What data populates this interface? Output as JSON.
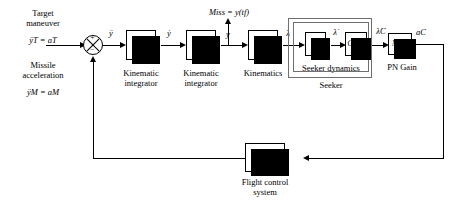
{
  "diagram": {
    "inputs": {
      "target_maneuver_caption_line1": "Target",
      "target_maneuver_caption_line2": "maneuver",
      "target_maneuver_equation": "ÿT = aT",
      "missile_accel_caption_line1": "Missile",
      "missile_accel_caption_line2": "acceleration",
      "missile_accel_equation": "ÿM = aM"
    },
    "summing_junction": {
      "name": "sum-junction",
      "sign_top": "+",
      "sign_bottom": "−"
    },
    "signals": {
      "accel_error": "ÿ",
      "rate": "ẏ",
      "displacement": "y",
      "los_angle": "λ",
      "los_rate": "λ̇",
      "los_rate_command": "λ̇C",
      "accel_command": "aC",
      "miss_distance": "Miss = y(tf)"
    },
    "blocks": [
      {
        "id": "kinematic-integrator-1",
        "text_num": "1",
        "text_den": "s",
        "caption_line1": "Kinematic",
        "caption_line2": "integrator"
      },
      {
        "id": "kinematic-integrator-2",
        "text_num": "1",
        "text_den": "s",
        "caption_line1": "Kinematic",
        "caption_line2": "integrator"
      },
      {
        "id": "kinematics",
        "text_num": "1",
        "text_den": "VCτ",
        "caption_line1": "Kinematics",
        "caption_line2": ""
      },
      {
        "id": "differentiator",
        "text": "s",
        "caption_line1": "",
        "caption_line2": ""
      },
      {
        "id": "seeker-transfer-function",
        "text": "G1(s)",
        "caption_line1": "",
        "caption_line2": ""
      },
      {
        "id": "pn-gain",
        "text": "N′VC",
        "caption_line1": "PN Gain",
        "caption_line2": ""
      },
      {
        "id": "flight-control-system",
        "text": "G2(s)",
        "caption_line1": "Flight control",
        "caption_line2": "system"
      }
    ],
    "groups": [
      {
        "id": "seeker-dynamics-group",
        "label": "Seeker dynamics"
      },
      {
        "id": "seeker-group",
        "label": "Seeker"
      }
    ],
    "colors": {
      "line": "#000000",
      "group_border": "#6f6f6f",
      "block_fill": "#ffffff",
      "block_shadow": "#000000",
      "background": "#ffffff"
    }
  }
}
